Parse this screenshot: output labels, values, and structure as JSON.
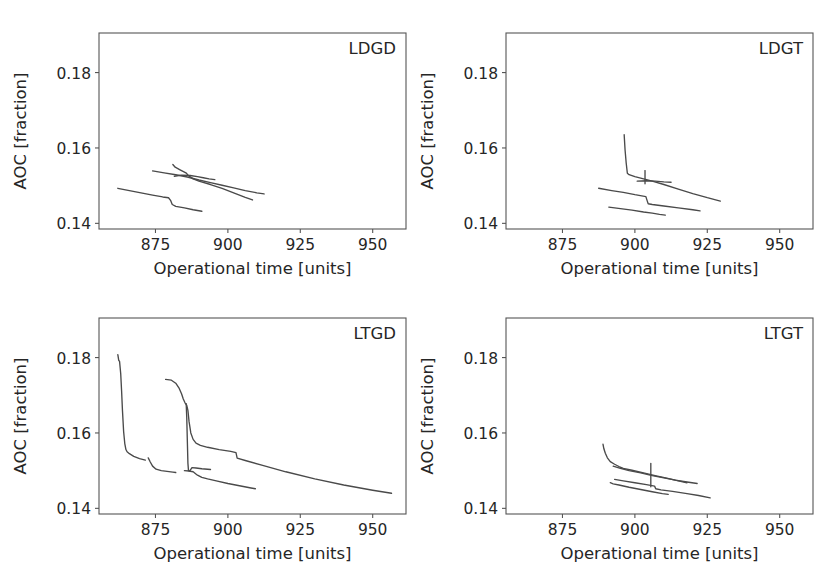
{
  "figure": {
    "width": 827,
    "height": 575,
    "background": "#ffffff",
    "line_color": "#4a4a4a",
    "axis_color": "#555555",
    "text_color": "#262626"
  },
  "axes_common": {
    "xlabel": "Operational time [units]",
    "ylabel": "AOC [fraction]",
    "xticks": [
      875,
      900,
      925,
      950
    ],
    "xticklabels": [
      "875",
      "900",
      "925",
      "950"
    ],
    "yticks": [
      0.14,
      0.16,
      0.18
    ],
    "yticklabels": [
      "0.14",
      "0.16",
      "0.18"
    ],
    "xlim": [
      855.5,
      961.5
    ],
    "ylim": [
      0.1385,
      0.1905
    ],
    "grid": false,
    "legend": "none"
  },
  "chart_data": [
    {
      "type": "line",
      "panel": "LDGD",
      "position": "top-left",
      "title": "LDGD",
      "xlabel": "Operational time [units]",
      "ylabel": "AOC [fraction]",
      "xlim": [
        855.5,
        961.5
      ],
      "ylim": [
        0.1385,
        0.1905
      ],
      "xticks": [
        875,
        900,
        925,
        950
      ],
      "yticks": [
        0.14,
        0.16,
        0.18
      ],
      "grid": false,
      "series": [
        {
          "name": "run-1",
          "x": [
            862.0,
            866.0,
            870.0,
            874.0,
            877.5,
            879.5,
            880.2,
            880.8,
            882.0,
            885.0,
            888.0,
            891.0
          ],
          "y": [
            0.1493,
            0.1487,
            0.1481,
            0.1475,
            0.147,
            0.1468,
            0.1461,
            0.145,
            0.1445,
            0.1441,
            0.1436,
            0.1432
          ]
        },
        {
          "name": "run-2",
          "x": [
            874.0,
            878.0,
            882.0,
            886.0,
            890.0,
            894.0,
            898.0,
            902.0,
            906.0,
            910.0,
            912.5
          ],
          "y": [
            0.1539,
            0.1534,
            0.1529,
            0.1523,
            0.1515,
            0.1508,
            0.1501,
            0.1494,
            0.1487,
            0.1481,
            0.1478
          ]
        },
        {
          "name": "run-3",
          "x": [
            881.0,
            881.8,
            883.5,
            885.5,
            886.5,
            888.0,
            890.0,
            894.0,
            898.0,
            902.0,
            906.0,
            908.5
          ],
          "y": [
            0.1556,
            0.1549,
            0.1542,
            0.1534,
            0.1526,
            0.1518,
            0.1512,
            0.1503,
            0.1493,
            0.1481,
            0.1469,
            0.1462
          ]
        },
        {
          "name": "run-4",
          "x": [
            881.5,
            884.0,
            887.0,
            889.5,
            891.5,
            893.5,
            895.5
          ],
          "y": [
            0.1525,
            0.1528,
            0.1527,
            0.1524,
            0.1521,
            0.1518,
            0.1516
          ]
        }
      ]
    },
    {
      "type": "line",
      "panel": "LDGT",
      "position": "top-right",
      "title": "LDGT",
      "xlabel": "Operational time [units]",
      "ylabel": "AOC [fraction]",
      "xlim": [
        855.5,
        961.5
      ],
      "ylim": [
        0.1385,
        0.1905
      ],
      "xticks": [
        875,
        900,
        925,
        950
      ],
      "yticks": [
        0.14,
        0.16,
        0.18
      ],
      "grid": false,
      "series": [
        {
          "name": "run-1",
          "x": [
            896.3,
            896.6,
            897.0,
            897.4,
            898.0,
            900.0,
            903.0,
            906.0,
            910.0,
            915.0,
            920.0,
            925.0,
            929.5
          ],
          "y": [
            0.1635,
            0.1596,
            0.156,
            0.1533,
            0.1529,
            0.1524,
            0.1518,
            0.1512,
            0.1503,
            0.1491,
            0.1479,
            0.1468,
            0.1459
          ]
        },
        {
          "name": "run-2",
          "x": [
            887.5,
            892.0,
            896.0,
            900.0,
            903.8,
            904.2,
            904.6,
            906.0,
            910.0,
            915.0,
            920.0,
            922.5
          ],
          "y": [
            0.1493,
            0.1487,
            0.1482,
            0.1476,
            0.1471,
            0.1461,
            0.1452,
            0.145,
            0.1446,
            0.1441,
            0.1436,
            0.1433
          ]
        },
        {
          "name": "run-3",
          "x": [
            891.0,
            895.0,
            899.0,
            903.0,
            906.0,
            908.5,
            910.5
          ],
          "y": [
            0.1443,
            0.1439,
            0.1435,
            0.143,
            0.1427,
            0.1424,
            0.1422
          ]
        },
        {
          "name": "run-4",
          "x": [
            903.5,
            903.5
          ],
          "y": [
            0.154,
            0.1505
          ]
        },
        {
          "name": "run-5",
          "x": [
            900.8,
            904.0,
            907.0,
            910.0,
            912.5
          ],
          "y": [
            0.1512,
            0.1513,
            0.1512,
            0.151,
            0.1509
          ]
        }
      ]
    },
    {
      "type": "line",
      "panel": "LTGD",
      "position": "bottom-left",
      "title": "LTGD",
      "xlabel": "Operational time [units]",
      "ylabel": "AOC [fraction]",
      "xlim": [
        855.5,
        961.5
      ],
      "ylim": [
        0.1385,
        0.1905
      ],
      "xticks": [
        875,
        900,
        925,
        950
      ],
      "yticks": [
        0.14,
        0.16,
        0.18
      ],
      "grid": false,
      "series": [
        {
          "name": "run-1",
          "x": [
            862.0,
            862.3,
            862.6,
            863.0,
            863.3,
            863.6,
            864.0,
            864.4,
            864.8,
            865.2,
            866.0,
            867.5,
            869.5,
            871.5
          ],
          "y": [
            0.1808,
            0.1793,
            0.179,
            0.1757,
            0.1712,
            0.166,
            0.1604,
            0.1572,
            0.1556,
            0.155,
            0.1545,
            0.1538,
            0.1532,
            0.1528
          ]
        },
        {
          "name": "run-2",
          "x": [
            872.5,
            873.2,
            874.0,
            875.2,
            877.0,
            879.0,
            881.0,
            882.0
          ],
          "y": [
            0.1534,
            0.1523,
            0.1512,
            0.1504,
            0.15,
            0.1498,
            0.1496,
            0.1495
          ]
        },
        {
          "name": "run-3",
          "x": [
            878.5,
            880.5,
            882.0,
            883.2,
            884.0,
            884.6,
            885.2,
            885.8,
            886.2,
            886.6,
            887.2,
            888.0,
            889.0,
            890.5,
            893.0,
            897.0,
            901.0,
            902.8,
            903.2,
            906.0,
            912.0,
            920.0,
            930.0,
            940.0,
            950.0,
            956.5
          ],
          "y": [
            0.1742,
            0.174,
            0.1732,
            0.1718,
            0.1704,
            0.169,
            0.168,
            0.1673,
            0.166,
            0.163,
            0.16,
            0.1583,
            0.1573,
            0.1567,
            0.1562,
            0.1556,
            0.1551,
            0.1548,
            0.1533,
            0.1527,
            0.1514,
            0.1497,
            0.1478,
            0.1462,
            0.1448,
            0.144
          ]
        },
        {
          "name": "run-4",
          "x": [
            885.6,
            885.8,
            886.0,
            886.2,
            886.4,
            886.8,
            887.6,
            889.0,
            891.0,
            894.0
          ],
          "y": [
            0.1678,
            0.164,
            0.158,
            0.152,
            0.15,
            0.1499,
            0.1508,
            0.1507,
            0.1505,
            0.1503
          ]
        },
        {
          "name": "run-5",
          "x": [
            885.0,
            886.5,
            888.0,
            889.5,
            891.0,
            893.0,
            896.0,
            900.0,
            904.0,
            908.0,
            909.5
          ],
          "y": [
            0.15,
            0.1499,
            0.1497,
            0.1488,
            0.1482,
            0.1478,
            0.1473,
            0.1466,
            0.146,
            0.1454,
            0.1452
          ]
        }
      ]
    },
    {
      "type": "line",
      "panel": "LTGT",
      "position": "bottom-right",
      "title": "LTGT",
      "xlabel": "Operational time [units]",
      "ylabel": "AOC [fraction]",
      "xlim": [
        855.5,
        961.5
      ],
      "ylim": [
        0.1385,
        0.1905
      ],
      "xticks": [
        875,
        900,
        925,
        950
      ],
      "yticks": [
        0.14,
        0.16,
        0.18
      ],
      "grid": false,
      "series": [
        {
          "name": "run-1",
          "x": [
            889.0,
            889.3,
            889.8,
            890.5,
            891.5,
            893.0,
            894.5,
            896.0,
            899.0,
            903.0,
            907.0,
            911.0,
            915.0,
            918.0
          ],
          "y": [
            0.157,
            0.1558,
            0.1546,
            0.1534,
            0.1524,
            0.1517,
            0.1511,
            0.1506,
            0.1501,
            0.1494,
            0.1487,
            0.148,
            0.1473,
            0.1468
          ]
        },
        {
          "name": "run-2",
          "x": [
            892.5,
            895.0,
            898.0,
            902.0,
            906.0,
            910.0,
            914.0,
            918.0,
            921.5
          ],
          "y": [
            0.1512,
            0.1506,
            0.15,
            0.1494,
            0.1487,
            0.1481,
            0.1475,
            0.147,
            0.1466
          ]
        },
        {
          "name": "run-3",
          "x": [
            893.0,
            896.0,
            900.0,
            904.0,
            906.8,
            907.2,
            909.0,
            913.0,
            918.0,
            922.0,
            926.0
          ],
          "y": [
            0.1477,
            0.1473,
            0.1468,
            0.1463,
            0.1459,
            0.1452,
            0.1449,
            0.1445,
            0.1439,
            0.1434,
            0.1428
          ]
        },
        {
          "name": "run-4",
          "x": [
            891.5,
            892.5,
            894.5,
            898.0,
            902.0,
            906.0,
            909.5,
            911.5
          ],
          "y": [
            0.1468,
            0.1465,
            0.1462,
            0.1456,
            0.145,
            0.1444,
            0.1439,
            0.1437
          ]
        },
        {
          "name": "run-5",
          "x": [
            905.5,
            905.5
          ],
          "y": [
            0.1519,
            0.1457
          ]
        }
      ]
    }
  ]
}
